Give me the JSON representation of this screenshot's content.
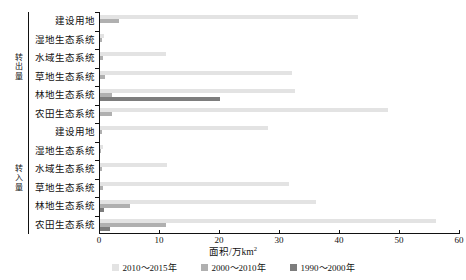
{
  "axes": {
    "xlabel_text": "面积/万km",
    "xlabel_sup": "2",
    "group_out": "转出量",
    "group_in": "转入量",
    "xticks": [
      "0",
      "10",
      "20",
      "30",
      "40",
      "50",
      "60"
    ]
  },
  "legend": [
    {
      "label": "2010～2015年",
      "color": "#e3e3e3"
    },
    {
      "label": "2000～2010年",
      "color": "#b0b0b0"
    },
    {
      "label": "1990～2000年",
      "color": "#7d7d7d"
    }
  ],
  "categories": [
    "建设用地",
    "湿地生态系统",
    "水域生态系统",
    "草地生态系统",
    "林地生态系统",
    "农田生态系统"
  ],
  "chart_data": {
    "type": "bar",
    "orientation": "horizontal",
    "title": "",
    "xlabel": "面积/万km²",
    "ylabel": "",
    "xlim": [
      0,
      60
    ],
    "xticks": [
      0,
      10,
      20,
      30,
      40,
      50,
      60
    ],
    "grid": false,
    "legend_position": "bottom",
    "groups": [
      {
        "name": "转出量",
        "categories": [
          "建设用地",
          "湿地生态系统",
          "水域生态系统",
          "草地生态系统",
          "林地生态系统",
          "农田生态系统"
        ],
        "series": [
          {
            "name": "2010～2015年",
            "color": "#e3e3e3",
            "values": [
              43.0,
              0.6,
              11.0,
              32.0,
              32.5,
              48.0
            ]
          },
          {
            "name": "2000～2010年",
            "color": "#b0b0b0",
            "values": [
              3.2,
              0.3,
              0.5,
              0.8,
              2.0,
              2.0
            ]
          },
          {
            "name": "1990～2000年",
            "color": "#7d7d7d",
            "values": [
              0.0,
              0.0,
              0.0,
              0.0,
              20.0,
              0.0
            ]
          }
        ]
      },
      {
        "name": "转入量",
        "categories": [
          "建设用地",
          "湿地生态系统",
          "水域生态系统",
          "草地生态系统",
          "林地生态系统",
          "农田生态系统"
        ],
        "series": [
          {
            "name": "2010～2015年",
            "color": "#e3e3e3",
            "values": [
              28.0,
              0.5,
              11.2,
              31.5,
              36.0,
              56.0
            ]
          },
          {
            "name": "2000～2010年",
            "color": "#b0b0b0",
            "values": [
              0.4,
              0.2,
              0.3,
              0.5,
              5.0,
              11.0
            ]
          },
          {
            "name": "1990～2000年",
            "color": "#7d7d7d",
            "values": [
              0.0,
              0.0,
              0.0,
              0.0,
              0.6,
              1.6
            ]
          }
        ]
      }
    ]
  }
}
